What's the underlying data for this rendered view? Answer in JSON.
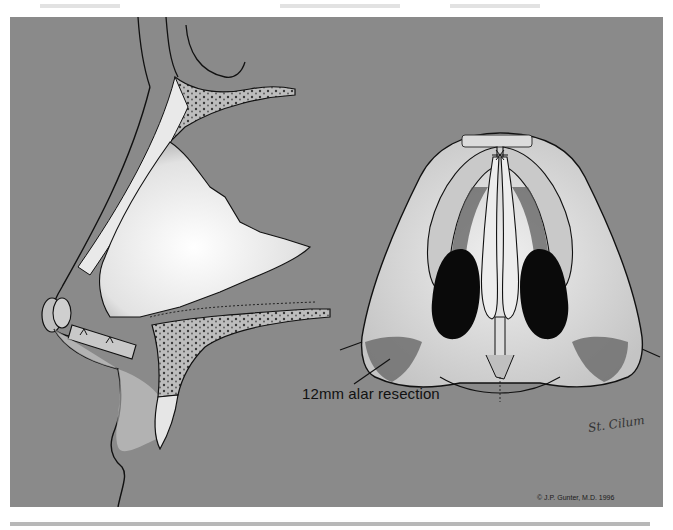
{
  "figure": {
    "type": "medical illustration",
    "background_color": "#8a8a8a",
    "page_background": "#ffffff"
  },
  "labels": {
    "alar_resection": "12mm alar resection",
    "copyright": "© J.P. Gunter, M.D. 1996",
    "signature": "St. Cilum"
  },
  "views": [
    {
      "name": "lateral-view",
      "description": "Side profile of the nose with nasal bones, septum, cartilage and tip graft"
    },
    {
      "name": "basal-view",
      "description": "Base view of the nose showing nostrils, columella and alar resection areas"
    }
  ]
}
